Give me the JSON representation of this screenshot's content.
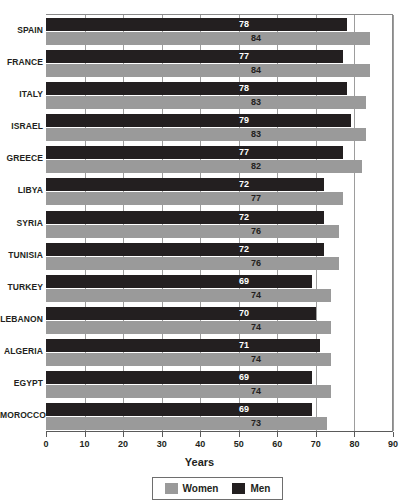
{
  "chart_data": {
    "type": "bar",
    "orientation": "horizontal",
    "title": "",
    "xlabel": "Years",
    "ylabel": "",
    "xlim": [
      0,
      90
    ],
    "xticks": [
      0,
      10,
      20,
      30,
      40,
      50,
      60,
      70,
      80,
      90
    ],
    "grid": true,
    "legend_position": "bottom",
    "categories": [
      "SPAIN",
      "FRANCE",
      "ITALY",
      "ISRAEL",
      "GREECE",
      "LIBYA",
      "SYRIA",
      "TUNISIA",
      "TURKEY",
      "LEBANON",
      "ALGERIA",
      "EGYPT",
      "MOROCCO"
    ],
    "series": [
      {
        "name": "Men",
        "color": "#231f20",
        "values": [
          78,
          77,
          78,
          79,
          77,
          72,
          72,
          72,
          69,
          70,
          71,
          69,
          69
        ]
      },
      {
        "name": "Women",
        "color": "#9a9a9a",
        "values": [
          84,
          84,
          83,
          83,
          82,
          77,
          76,
          76,
          74,
          74,
          74,
          74,
          73
        ]
      }
    ]
  },
  "axis": {
    "x_title": "Years",
    "tick_labels": [
      "0",
      "10",
      "20",
      "30",
      "40",
      "50",
      "60",
      "70",
      "80",
      "90"
    ]
  },
  "legend": {
    "items": [
      {
        "label": "Women",
        "color": "#9a9a9a"
      },
      {
        "label": "Men",
        "color": "#231f20"
      }
    ]
  },
  "colors": {
    "men": "#231f20",
    "women": "#9a9a9a",
    "grid": "#9d9d9d",
    "axis": "#5a5a5a",
    "text": "#231f20"
  }
}
